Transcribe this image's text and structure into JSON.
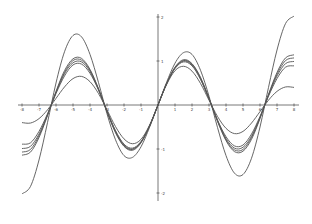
{
  "chart_data": {
    "type": "line",
    "title": "",
    "xlabel": "",
    "ylabel": "",
    "xlim": [
      -8.3,
      8.3
    ],
    "ylim": [
      -2.1,
      2.1
    ],
    "grid": false,
    "legend": null,
    "x_ticks": [
      -8,
      -7,
      -6,
      -5,
      -4,
      -3,
      -2,
      -1,
      1,
      2,
      3,
      4,
      5,
      6,
      7,
      8
    ],
    "x_tick_labels": [
      "-8",
      "-7",
      "-6",
      "-5",
      "-4",
      "-3",
      "-2",
      "-1",
      "1",
      "2",
      "3",
      "4",
      "5",
      "6",
      "7",
      "8"
    ],
    "y_ticks": [
      -2,
      -1,
      1,
      2
    ],
    "y_tick_labels": [
      "-2",
      "-1",
      "1",
      "2"
    ],
    "x": [
      -8,
      -7.5,
      -7,
      -6.5,
      -6,
      -5.5,
      -5,
      -4.5,
      -4,
      -3.5,
      -3,
      -2.5,
      -2,
      -1.5,
      -1,
      -0.5,
      0,
      0.5,
      1,
      1.5,
      2,
      2.5,
      3,
      3.5,
      4,
      4.5,
      5,
      5.5,
      6,
      6.5,
      7,
      7.5,
      8
    ],
    "series": [
      {
        "name": "curve-1",
        "values": [
          -2.02,
          -1.85,
          -1.25,
          -0.4,
          0.5,
          1.21,
          1.58,
          1.55,
          1.15,
          0.51,
          -0.2,
          -0.79,
          -1.15,
          -1.19,
          -0.95,
          -0.51,
          0,
          0.51,
          0.95,
          1.19,
          1.15,
          0.79,
          0.2,
          -0.51,
          -1.15,
          -1.55,
          -1.58,
          -1.21,
          -0.5,
          0.4,
          1.25,
          1.85,
          2.02
        ]
      },
      {
        "name": "curve-2",
        "values": [
          -1.14,
          -1.07,
          -0.74,
          -0.24,
          0.31,
          0.78,
          1.05,
          1.06,
          0.81,
          0.37,
          -0.15,
          -0.63,
          -0.94,
          -1.03,
          -0.86,
          -0.48,
          0,
          0.48,
          0.86,
          1.03,
          0.94,
          0.63,
          0.15,
          -0.37,
          -0.81,
          -1.06,
          -1.05,
          -0.78,
          -0.31,
          0.24,
          0.74,
          1.07,
          1.14
        ]
      },
      {
        "name": "curve-3",
        "values": [
          -1.07,
          -1.01,
          -0.7,
          -0.23,
          0.29,
          0.74,
          1.01,
          1.02,
          0.79,
          0.36,
          -0.15,
          -0.61,
          -0.93,
          -1.01,
          -0.85,
          -0.48,
          0,
          0.48,
          0.85,
          1.01,
          0.93,
          0.61,
          0.15,
          -0.36,
          -0.79,
          -1.02,
          -1.01,
          -0.74,
          -0.29,
          0.23,
          0.7,
          1.01,
          1.07
        ]
      },
      {
        "name": "curve-4",
        "values": [
          -0.99,
          -0.94,
          -0.66,
          -0.22,
          0.28,
          0.71,
          0.96,
          0.98,
          0.76,
          0.35,
          -0.14,
          -0.6,
          -0.91,
          -1.0,
          -0.84,
          -0.48,
          0,
          0.48,
          0.84,
          1.0,
          0.91,
          0.6,
          0.14,
          -0.35,
          -0.76,
          -0.98,
          -0.96,
          -0.71,
          -0.28,
          0.22,
          0.66,
          0.94,
          0.99
        ]
      },
      {
        "name": "curve-5",
        "values": [
          -0.89,
          -0.86,
          -0.6,
          -0.2,
          0.26,
          0.66,
          0.91,
          0.93,
          0.72,
          0.34,
          -0.14,
          -0.58,
          -0.89,
          -0.98,
          -0.83,
          -0.48,
          0,
          0.48,
          0.83,
          0.98,
          0.89,
          0.58,
          0.14,
          -0.34,
          -0.72,
          -0.93,
          -0.91,
          -0.66,
          -0.26,
          0.2,
          0.6,
          0.86,
          0.89
        ]
      },
      {
        "name": "curve-6",
        "values": [
          -0.4,
          -0.41,
          -0.31,
          -0.11,
          0.15,
          0.41,
          0.6,
          0.65,
          0.53,
          0.26,
          -0.11,
          -0.49,
          -0.77,
          -0.88,
          -0.78,
          -0.46,
          0,
          0.46,
          0.78,
          0.88,
          0.77,
          0.49,
          0.11,
          -0.26,
          -0.53,
          -0.65,
          -0.6,
          -0.41,
          -0.15,
          0.11,
          0.31,
          0.41,
          0.4
        ]
      }
    ]
  }
}
